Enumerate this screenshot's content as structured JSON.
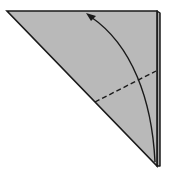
{
  "diagram": {
    "type": "origami-fold-step",
    "background": "#ffffff",
    "paper_color": "#b9b9b9",
    "line_color": "#1a1a1a",
    "shapes": {
      "main_triangle": {
        "points": [
          [
            7,
            11
          ],
          [
            157,
            11
          ],
          [
            157,
            166
          ]
        ]
      },
      "back_layer_edge": {
        "points": [
          [
            157,
            11
          ],
          [
            160,
            13
          ],
          [
            160,
            166
          ],
          [
            157,
            166
          ]
        ]
      },
      "valley_fold_line": {
        "from": [
          95,
          102
        ],
        "to": [
          156,
          71
        ],
        "style": "dashed"
      },
      "fold_arrow": {
        "path": "M155,162 C152,100 132,45 88,15",
        "head_at": [
          88,
          15
        ],
        "direction": "up-left"
      }
    }
  }
}
